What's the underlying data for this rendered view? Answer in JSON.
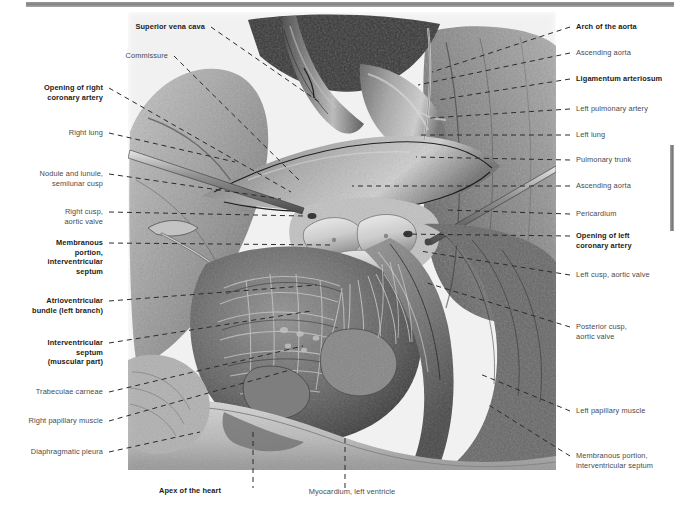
{
  "figure": {
    "type": "anatomical-illustration",
    "style": "grayscale halftone medical atlas plate",
    "top_rule_color": "#8a8a8a",
    "edge_rule_color": "#7a7a7a",
    "leader_line_color": "#2b2b2b",
    "label_color": "#4a4a4a",
    "label_bold_color": "#1b1b1b"
  },
  "labels_left": [
    {
      "id": "superior-vena-cava",
      "text": "Superior vena cava",
      "bold": true,
      "x": 205,
      "y": 22,
      "tip_x": 322,
      "tip_y": 104
    },
    {
      "id": "commissure",
      "text": "Commissure",
      "bold": false,
      "x": 168,
      "y": 51,
      "tip_x": 300,
      "tip_y": 181
    },
    {
      "id": "opening-of-right-coronary-artery",
      "text": "Opening of right\ncoronary artery",
      "bold": true,
      "x": 103,
      "y": 83,
      "tip_x": 291,
      "tip_y": 192
    },
    {
      "id": "right-lung",
      "text": "Right lung",
      "bold": false,
      "x": 103,
      "y": 128,
      "tip_x": 235,
      "tip_y": 162
    },
    {
      "id": "nodule-and-lunule",
      "text": "Nodule and lunule,\nsemilunar cusp",
      "bold": false,
      "x": 103,
      "y": 169,
      "tip_x": 281,
      "tip_y": 199
    },
    {
      "id": "right-cusp-aortic-valve",
      "text": "Right cusp,\naortic valve",
      "bold": false,
      "x": 103,
      "y": 207,
      "tip_x": 304,
      "tip_y": 216
    },
    {
      "id": "membranous-portion-ivs",
      "text": "Membranous\nportion,\ninterventricular\nseptum",
      "bold": true,
      "x": 103,
      "y": 238,
      "tip_x": 330,
      "tip_y": 245
    },
    {
      "id": "atrioventricular-bundle",
      "text": "Atrioventricular\nbundle (left branch)",
      "bold": true,
      "x": 103,
      "y": 296,
      "tip_x": 317,
      "tip_y": 285
    },
    {
      "id": "interventricular-septum-muscular",
      "text": "Interventricular\nseptum\n(muscular part)",
      "bold": true,
      "x": 103,
      "y": 338,
      "tip_x": 311,
      "tip_y": 311
    },
    {
      "id": "trabeculae-carneae",
      "text": "Trabeculae carneae",
      "bold": false,
      "x": 103,
      "y": 387,
      "tip_x": 303,
      "tip_y": 346
    },
    {
      "id": "right-papillary-muscle",
      "text": "Right papillary muscle",
      "bold": false,
      "x": 103,
      "y": 416,
      "tip_x": 290,
      "tip_y": 370
    },
    {
      "id": "diaphragmatic-pleura",
      "text": "Diaphragmatic pleura",
      "bold": false,
      "x": 103,
      "y": 447,
      "tip_x": 200,
      "tip_y": 432
    }
  ],
  "labels_right": [
    {
      "id": "arch-of-the-aorta",
      "text": "Arch of the aorta",
      "bold": true,
      "x": 576,
      "y": 22,
      "tip_x": 432,
      "tip_y": 72
    },
    {
      "id": "ascending-aorta-top",
      "text": "Ascending aorta",
      "bold": false,
      "x": 576,
      "y": 48,
      "tip_x": 418,
      "tip_y": 85
    },
    {
      "id": "ligamentum-arteriosum",
      "text": "Ligamentum arteriosum",
      "bold": true,
      "x": 576,
      "y": 74,
      "tip_x": 438,
      "tip_y": 100
    },
    {
      "id": "left-pulmonary-artery",
      "text": "Left pulmonary artery",
      "bold": false,
      "x": 576,
      "y": 104,
      "tip_x": 430,
      "tip_y": 118
    },
    {
      "id": "left-lung",
      "text": "Left lung",
      "bold": false,
      "x": 576,
      "y": 130,
      "tip_x": 420,
      "tip_y": 135
    },
    {
      "id": "pulmonary-trunk",
      "text": "Pulmonary trunk",
      "bold": false,
      "x": 576,
      "y": 155,
      "tip_x": 416,
      "tip_y": 157
    },
    {
      "id": "ascending-aorta-mid",
      "text": "Ascending aorta",
      "bold": false,
      "x": 576,
      "y": 181,
      "tip_x": 352,
      "tip_y": 186
    },
    {
      "id": "pericardium",
      "text": "Pericardium",
      "bold": false,
      "x": 576,
      "y": 209,
      "tip_x": 447,
      "tip_y": 210
    },
    {
      "id": "opening-of-left-coronary-artery",
      "text": "Opening of left\ncoronary artery",
      "bold": true,
      "x": 576,
      "y": 231,
      "tip_x": 400,
      "tip_y": 234
    },
    {
      "id": "left-cusp-aortic-valve",
      "text": "Left cusp, aortic valve",
      "bold": false,
      "x": 576,
      "y": 270,
      "tip_x": 420,
      "tip_y": 251
    },
    {
      "id": "posterior-cusp-aortic-valve",
      "text": "Posterior cusp,\naortic valve",
      "bold": false,
      "x": 576,
      "y": 322,
      "tip_x": 424,
      "tip_y": 282
    },
    {
      "id": "left-papillary-muscle",
      "text": "Left papillary muscle",
      "bold": false,
      "x": 576,
      "y": 406,
      "tip_x": 480,
      "tip_y": 374
    },
    {
      "id": "membranous-portion-ivs-right",
      "text": "Membranous portion,\ninterventricular septum",
      "bold": false,
      "x": 576,
      "y": 451,
      "tip_x": 487,
      "tip_y": 404
    }
  ],
  "labels_bottom": [
    {
      "id": "apex-of-the-heart",
      "text": "Apex of the heart",
      "bold": true,
      "x": 190,
      "y": 486,
      "tip_x": 253,
      "tip_y": 432,
      "stem_x": 253
    },
    {
      "id": "myocardium-left-ventricle",
      "text": "Myocardium, left ventricle",
      "bold": false,
      "x": 352,
      "y": 487,
      "tip_x": 345,
      "tip_y": 438,
      "stem_x": 345
    }
  ]
}
